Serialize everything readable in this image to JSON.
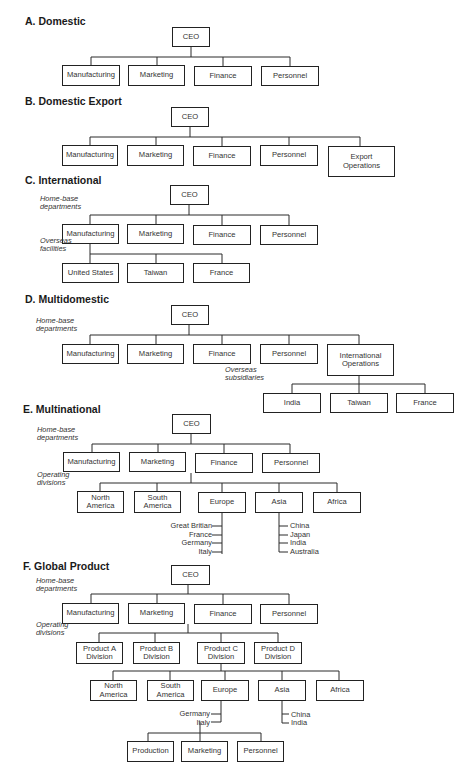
{
  "figure": {
    "sections": [
      {
        "id": "A",
        "title": "A. Domestic",
        "title_pos": [
          25,
          21
        ],
        "boxes": [
          {
            "label": "CEO",
            "x": 172,
            "y": 27,
            "w": 38,
            "h": 20
          },
          {
            "label": "Manufacturing",
            "x": 62,
            "y": 65,
            "w": 58,
            "h": 21
          },
          {
            "label": "Marketing",
            "x": 128,
            "y": 65,
            "w": 57,
            "h": 21
          },
          {
            "label": "Finance",
            "x": 194,
            "y": 66,
            "w": 58,
            "h": 20
          },
          {
            "label": "Personnel",
            "x": 261,
            "y": 66,
            "w": 58,
            "h": 20
          }
        ],
        "notes": [],
        "leaves": [],
        "lines": [
          [
            191,
            47,
            191,
            57
          ],
          [
            91,
            57,
            290,
            57
          ],
          [
            91,
            57,
            91,
            65
          ],
          [
            157,
            57,
            157,
            65
          ],
          [
            223,
            57,
            223,
            66
          ],
          [
            290,
            57,
            290,
            66
          ]
        ]
      },
      {
        "id": "B",
        "title": "B. Domestic Export",
        "title_pos": [
          25,
          101
        ],
        "boxes": [
          {
            "label": "CEO",
            "x": 171,
            "y": 107,
            "w": 38,
            "h": 20
          },
          {
            "label": "Manufacturing",
            "x": 62,
            "y": 145,
            "w": 56,
            "h": 21
          },
          {
            "label": "Marketing",
            "x": 127,
            "y": 145,
            "w": 57,
            "h": 21
          },
          {
            "label": "Finance",
            "x": 193,
            "y": 146,
            "w": 58,
            "h": 20
          },
          {
            "label": "Personnel",
            "x": 260,
            "y": 145,
            "w": 58,
            "h": 21
          },
          {
            "label": "Export\nOperations",
            "x": 328,
            "y": 146,
            "w": 67,
            "h": 31
          }
        ],
        "notes": [],
        "leaves": [],
        "lines": [
          [
            190,
            127,
            190,
            137
          ],
          [
            90,
            137,
            360,
            137
          ],
          [
            90,
            137,
            90,
            145
          ],
          [
            156,
            137,
            156,
            145
          ],
          [
            222,
            137,
            222,
            146
          ],
          [
            289,
            137,
            289,
            145
          ],
          [
            360,
            137,
            360,
            146
          ]
        ]
      },
      {
        "id": "C",
        "title": "C. International",
        "title_pos": [
          25,
          180
        ],
        "boxes": [
          {
            "label": "CEO",
            "x": 170,
            "y": 185,
            "w": 39,
            "h": 20
          },
          {
            "label": "Manufacturing",
            "x": 62,
            "y": 224,
            "w": 57,
            "h": 20
          },
          {
            "label": "Marketing",
            "x": 127,
            "y": 224,
            "w": 57,
            "h": 20
          },
          {
            "label": "Finance",
            "x": 193,
            "y": 225,
            "w": 58,
            "h": 20
          },
          {
            "label": "Personnel",
            "x": 260,
            "y": 225,
            "w": 58,
            "h": 20
          },
          {
            "label": "United States",
            "x": 62,
            "y": 263,
            "w": 57,
            "h": 20
          },
          {
            "label": "Taiwan",
            "x": 127,
            "y": 263,
            "w": 57,
            "h": 20
          },
          {
            "label": "France",
            "x": 193,
            "y": 263,
            "w": 57,
            "h": 20
          }
        ],
        "notes": [
          {
            "text": "Home-base\ndepartments",
            "x": 40,
            "y": 203
          },
          {
            "text": "Overseas\nfacilities",
            "x": 40,
            "y": 245
          }
        ],
        "leaves": [],
        "lines": [
          [
            189,
            205,
            189,
            215
          ],
          [
            90,
            215,
            289,
            215
          ],
          [
            90,
            215,
            90,
            224
          ],
          [
            156,
            215,
            156,
            224
          ],
          [
            222,
            215,
            222,
            225
          ],
          [
            289,
            215,
            289,
            225
          ],
          [
            90,
            244,
            90,
            263
          ],
          [
            90,
            254,
            222,
            254
          ],
          [
            156,
            254,
            156,
            263
          ],
          [
            222,
            254,
            222,
            263
          ]
        ]
      },
      {
        "id": "D",
        "title": "D. Multidomestic",
        "title_pos": [
          25,
          299
        ],
        "boxes": [
          {
            "label": "CEO",
            "x": 171,
            "y": 305,
            "w": 38,
            "h": 20
          },
          {
            "label": "Manufacturing",
            "x": 62,
            "y": 344,
            "w": 57,
            "h": 20
          },
          {
            "label": "Marketing",
            "x": 127,
            "y": 344,
            "w": 57,
            "h": 20
          },
          {
            "label": "Finance",
            "x": 193,
            "y": 344,
            "w": 58,
            "h": 20
          },
          {
            "label": "Personnel",
            "x": 260,
            "y": 344,
            "w": 58,
            "h": 20
          },
          {
            "label": "International\nOperations",
            "x": 327,
            "y": 344,
            "w": 67,
            "h": 32
          },
          {
            "label": "India",
            "x": 263,
            "y": 393,
            "w": 58,
            "h": 20
          },
          {
            "label": "Taiwan",
            "x": 330,
            "y": 393,
            "w": 58,
            "h": 20
          },
          {
            "label": "France",
            "x": 396,
            "y": 393,
            "w": 58,
            "h": 20
          }
        ],
        "notes": [
          {
            "text": "Home-base\ndepartments",
            "x": 36,
            "y": 325
          },
          {
            "text": "Overseas\nsubsidiaries",
            "x": 225,
            "y": 374
          }
        ],
        "leaves": [],
        "lines": [
          [
            189,
            325,
            189,
            335
          ],
          [
            90,
            335,
            359,
            335
          ],
          [
            90,
            335,
            90,
            344
          ],
          [
            156,
            335,
            156,
            344
          ],
          [
            222,
            335,
            222,
            344
          ],
          [
            289,
            335,
            289,
            344
          ],
          [
            359,
            335,
            359,
            344
          ],
          [
            359,
            376,
            359,
            384
          ],
          [
            292,
            384,
            425,
            384
          ],
          [
            292,
            384,
            292,
            393
          ],
          [
            359,
            384,
            359,
            393
          ],
          [
            425,
            384,
            425,
            393
          ]
        ]
      },
      {
        "id": "E",
        "title": "E. Multinational",
        "title_pos": [
          23,
          409
        ],
        "boxes": [
          {
            "label": "CEO",
            "x": 172,
            "y": 414,
            "w": 39,
            "h": 20
          },
          {
            "label": "Manufacturing",
            "x": 63,
            "y": 452,
            "w": 57,
            "h": 20
          },
          {
            "label": "Marketing",
            "x": 129,
            "y": 452,
            "w": 57,
            "h": 20
          },
          {
            "label": "Finance",
            "x": 195,
            "y": 453,
            "w": 58,
            "h": 20
          },
          {
            "label": "Personnel",
            "x": 262,
            "y": 453,
            "w": 58,
            "h": 20
          },
          {
            "label": "North\nAmerica",
            "x": 77,
            "y": 491,
            "w": 47,
            "h": 22
          },
          {
            "label": "South\nAmerica",
            "x": 134,
            "y": 491,
            "w": 47,
            "h": 22
          },
          {
            "label": "Europe",
            "x": 198,
            "y": 492,
            "w": 48,
            "h": 21
          },
          {
            "label": "Asia",
            "x": 255,
            "y": 492,
            "w": 48,
            "h": 21
          },
          {
            "label": "Africa",
            "x": 313,
            "y": 492,
            "w": 48,
            "h": 21
          }
        ],
        "notes": [
          {
            "text": "Home-base\ndepartments",
            "x": 37,
            "y": 434
          },
          {
            "text": "Operating\ndivisions",
            "x": 37,
            "y": 479
          }
        ],
        "leaves": [
          {
            "text": "Great Britian",
            "x": 212,
            "y": 522,
            "align": "right"
          },
          {
            "text": "France",
            "x": 212,
            "y": 531,
            "align": "right"
          },
          {
            "text": "Germany",
            "x": 212,
            "y": 539,
            "align": "right"
          },
          {
            "text": "Italy",
            "x": 212,
            "y": 548,
            "align": "right"
          },
          {
            "text": "China",
            "x": 290,
            "y": 522,
            "align": "left"
          },
          {
            "text": "Japan",
            "x": 290,
            "y": 531,
            "align": "left"
          },
          {
            "text": "India",
            "x": 290,
            "y": 539,
            "align": "left"
          },
          {
            "text": "Australia",
            "x": 290,
            "y": 548,
            "align": "left"
          }
        ],
        "lines": [
          [
            191,
            434,
            191,
            444
          ],
          [
            92,
            444,
            290,
            444
          ],
          [
            92,
            444,
            92,
            452
          ],
          [
            158,
            444,
            158,
            452
          ],
          [
            224,
            444,
            224,
            453
          ],
          [
            290,
            444,
            290,
            453
          ],
          [
            191,
            473,
            191,
            483
          ],
          [
            100,
            483,
            337,
            483
          ],
          [
            100,
            483,
            100,
            491
          ],
          [
            157,
            483,
            157,
            491
          ],
          [
            222,
            483,
            222,
            492
          ],
          [
            279,
            483,
            279,
            492
          ],
          [
            337,
            483,
            337,
            492
          ],
          [
            222,
            513,
            222,
            554
          ],
          [
            212,
            526,
            222,
            526
          ],
          [
            212,
            535,
            222,
            535
          ],
          [
            212,
            543,
            222,
            543
          ],
          [
            212,
            552,
            222,
            552
          ],
          [
            279,
            513,
            279,
            552
          ],
          [
            279,
            526,
            288,
            526
          ],
          [
            279,
            535,
            288,
            535
          ],
          [
            279,
            543,
            288,
            543
          ],
          [
            279,
            552,
            288,
            552
          ]
        ]
      },
      {
        "id": "F",
        "title": "F. Global Product",
        "title_pos": [
          23,
          566
        ],
        "boxes": [
          {
            "label": "CEO",
            "x": 171,
            "y": 565,
            "w": 39,
            "h": 20
          },
          {
            "label": "Manufacturing",
            "x": 62,
            "y": 603,
            "w": 57,
            "h": 21
          },
          {
            "label": "Marketing",
            "x": 128,
            "y": 603,
            "w": 57,
            "h": 21
          },
          {
            "label": "Finance",
            "x": 194,
            "y": 604,
            "w": 58,
            "h": 20
          },
          {
            "label": "Personnel",
            "x": 260,
            "y": 604,
            "w": 58,
            "h": 20
          },
          {
            "label": "Product A\nDivision",
            "x": 76,
            "y": 642,
            "w": 47,
            "h": 22
          },
          {
            "label": "Product B\nDivision",
            "x": 133,
            "y": 642,
            "w": 47,
            "h": 22
          },
          {
            "label": "Product C\nDivision",
            "x": 197,
            "y": 642,
            "w": 48,
            "h": 22
          },
          {
            "label": "Product D\nDivision",
            "x": 254,
            "y": 642,
            "w": 48,
            "h": 22
          },
          {
            "label": "North\nAmerica",
            "x": 90,
            "y": 680,
            "w": 47,
            "h": 21
          },
          {
            "label": "South\nAmerica",
            "x": 147,
            "y": 680,
            "w": 47,
            "h": 21
          },
          {
            "label": "Europe",
            "x": 201,
            "y": 680,
            "w": 48,
            "h": 21
          },
          {
            "label": "Asia",
            "x": 258,
            "y": 680,
            "w": 48,
            "h": 21
          },
          {
            "label": "Africa",
            "x": 316,
            "y": 680,
            "w": 48,
            "h": 21
          },
          {
            "label": "Production",
            "x": 127,
            "y": 741,
            "w": 47,
            "h": 21
          },
          {
            "label": "Marketing",
            "x": 181,
            "y": 741,
            "w": 47,
            "h": 21
          },
          {
            "label": "Personnel",
            "x": 237,
            "y": 741,
            "w": 47,
            "h": 21
          }
        ],
        "notes": [
          {
            "text": "Home-base\ndepartments",
            "x": 36,
            "y": 585
          },
          {
            "text": "Operating\ndivisions",
            "x": 36,
            "y": 629
          }
        ],
        "leaves": [
          {
            "text": "Germany",
            "x": 210,
            "y": 710,
            "align": "right"
          },
          {
            "text": "Italy",
            "x": 210,
            "y": 719,
            "align": "right"
          },
          {
            "text": "China",
            "x": 291,
            "y": 711,
            "align": "left"
          },
          {
            "text": "India",
            "x": 291,
            "y": 719,
            "align": "left"
          }
        ],
        "lines": [
          [
            188,
            585,
            188,
            594
          ],
          [
            91,
            594,
            289,
            594
          ],
          [
            91,
            594,
            91,
            603
          ],
          [
            157,
            594,
            157,
            603
          ],
          [
            223,
            594,
            223,
            604
          ],
          [
            289,
            594,
            289,
            604
          ],
          [
            188,
            624,
            188,
            633
          ],
          [
            99,
            633,
            278,
            633
          ],
          [
            99,
            633,
            99,
            642
          ],
          [
            155,
            633,
            155,
            642
          ],
          [
            221,
            633,
            221,
            642
          ],
          [
            278,
            633,
            278,
            642
          ],
          [
            221,
            664,
            221,
            671
          ],
          [
            113,
            671,
            339,
            671
          ],
          [
            113,
            671,
            113,
            680
          ],
          [
            170,
            671,
            170,
            680
          ],
          [
            225,
            671,
            225,
            680
          ],
          [
            282,
            671,
            282,
            680
          ],
          [
            339,
            671,
            339,
            680
          ],
          [
            221,
            701,
            221,
            722
          ],
          [
            211,
            714,
            221,
            714
          ],
          [
            211,
            722,
            221,
            722
          ],
          [
            282,
            701,
            282,
            723
          ],
          [
            282,
            714,
            289,
            714
          ],
          [
            282,
            723,
            289,
            723
          ],
          [
            200,
            722,
            200,
            733
          ],
          [
            148,
            733,
            261,
            733
          ],
          [
            148,
            733,
            148,
            741
          ],
          [
            200,
            733,
            200,
            741
          ],
          [
            261,
            733,
            261,
            741
          ]
        ]
      }
    ]
  }
}
